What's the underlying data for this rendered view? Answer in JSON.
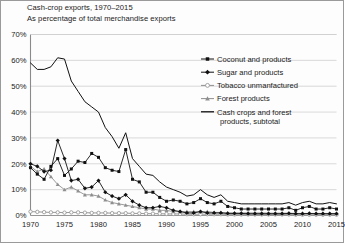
{
  "title": {
    "line1": "Cash-crop exports, 1970–2015",
    "line2": "As percentage of total merchandise exports"
  },
  "colors": {
    "coconut": "#111111",
    "sugar": "#111111",
    "tobacco": "#8f8f8f",
    "forest": "#8f8f8f",
    "subtotal": "#111111",
    "grid": "#cfcfcf",
    "axis": "#8a8a8a",
    "frame": "#9a9a9a",
    "text": "#1a1a1a",
    "background": "#fdfdfd"
  },
  "legend": {
    "position": "top-right",
    "items": [
      {
        "label": "Coconut and products",
        "marker": "filled-square",
        "color": "#111111"
      },
      {
        "label": "Sugar and products",
        "marker": "filled-diamond",
        "color": "#111111"
      },
      {
        "label": "Tobacco unmanfactured",
        "marker": "open-circle",
        "color": "#8f8f8f"
      },
      {
        "label": "Forest products",
        "marker": "filled-triangle",
        "color": "#8f8f8f"
      },
      {
        "label": "Cash crops and forest",
        "label2": "products, subtotal",
        "marker": "plain-line",
        "color": "#111111"
      }
    ]
  },
  "chart_data": {
    "type": "line",
    "title": "Cash-crop exports, 1970–2015",
    "subtitle": "As percentage of total merchandise exports",
    "xlabel": "",
    "ylabel": "As percentage of total merchandise exports",
    "xlim": [
      1970,
      2015
    ],
    "ylim": [
      0,
      70
    ],
    "ytick_labels": [
      "0%",
      "10%",
      "20%",
      "30%",
      "40%",
      "50%",
      "60%",
      "70%"
    ],
    "ytick_values": [
      0,
      10,
      20,
      30,
      40,
      50,
      60,
      70
    ],
    "xtick_labels": [
      "1970",
      "1975",
      "1980",
      "1985",
      "1990",
      "1995",
      "2000",
      "2005",
      "2010",
      "2015"
    ],
    "xtick_values": [
      1970,
      1975,
      1980,
      1985,
      1990,
      1995,
      2000,
      2005,
      2010,
      2015
    ],
    "grid": "horizontal",
    "x": [
      1970,
      1971,
      1972,
      1973,
      1974,
      1975,
      1976,
      1977,
      1978,
      1979,
      1980,
      1981,
      1982,
      1983,
      1984,
      1985,
      1986,
      1987,
      1988,
      1989,
      1990,
      1991,
      1992,
      1993,
      1994,
      1995,
      1996,
      1997,
      1998,
      1999,
      2000,
      2001,
      2002,
      2003,
      2004,
      2005,
      2006,
      2007,
      2008,
      2009,
      2010,
      2011,
      2012,
      2013,
      2014,
      2015
    ],
    "series": [
      {
        "name": "Coconut and products",
        "marker": "filled-square",
        "color": "#111111",
        "values": [
          18.5,
          16.0,
          14.0,
          19.0,
          22.0,
          15.5,
          18.0,
          21.0,
          20.5,
          24.0,
          22.5,
          18.5,
          17.5,
          17.0,
          25.5,
          14.0,
          13.0,
          9.0,
          9.0,
          7.0,
          5.5,
          6.0,
          5.5,
          4.5,
          5.0,
          6.5,
          5.0,
          4.5,
          5.5,
          3.5,
          3.0,
          2.5,
          2.5,
          2.5,
          2.5,
          2.5,
          2.5,
          2.5,
          3.0,
          2.0,
          3.0,
          3.5,
          2.5,
          2.5,
          3.0,
          2.5
        ]
      },
      {
        "name": "Sugar and products",
        "marker": "filled-diamond",
        "color": "#111111",
        "values": [
          20.0,
          19.0,
          17.0,
          17.5,
          29.0,
          22.0,
          13.5,
          14.0,
          10.5,
          11.0,
          13.5,
          9.0,
          7.5,
          6.5,
          8.0,
          5.5,
          4.0,
          3.0,
          3.0,
          3.5,
          3.0,
          2.0,
          1.5,
          1.0,
          1.0,
          1.5,
          1.0,
          1.0,
          1.0,
          0.8,
          0.8,
          0.8,
          0.7,
          0.7,
          0.7,
          0.7,
          0.7,
          0.7,
          0.8,
          0.7,
          0.7,
          0.8,
          0.7,
          0.7,
          0.7,
          0.7
        ]
      },
      {
        "name": "Tobacco unmanfactured",
        "marker": "open-circle",
        "color": "#8f8f8f",
        "values": [
          1.5,
          1.4,
          1.3,
          1.2,
          1.2,
          1.1,
          1.2,
          1.2,
          1.1,
          1.0,
          1.0,
          1.0,
          0.9,
          0.9,
          0.9,
          0.8,
          0.8,
          0.7,
          0.7,
          0.7,
          0.6,
          0.6,
          0.6,
          0.5,
          0.5,
          0.5,
          0.5,
          0.5,
          0.5,
          0.4,
          0.4,
          0.4,
          0.4,
          0.4,
          0.4,
          0.4,
          0.4,
          0.4,
          0.4,
          0.3,
          0.3,
          0.3,
          0.3,
          0.3,
          0.3,
          0.3
        ]
      },
      {
        "name": "Forest products",
        "marker": "filled-triangle",
        "color": "#8f8f8f",
        "values": [
          19.0,
          17.0,
          18.0,
          15.0,
          12.0,
          10.0,
          11.0,
          9.5,
          8.0,
          8.0,
          7.5,
          6.0,
          5.0,
          4.5,
          4.0,
          3.5,
          3.0,
          2.5,
          2.5,
          2.0,
          2.0,
          1.5,
          1.5,
          1.5,
          1.5,
          1.5,
          1.5,
          1.2,
          1.2,
          1.0,
          1.0,
          1.0,
          1.0,
          1.0,
          1.0,
          0.9,
          0.9,
          0.9,
          0.9,
          0.8,
          0.8,
          0.8,
          0.8,
          0.8,
          0.8,
          0.8
        ]
      },
      {
        "name": "Cash crops and forest products, subtotal",
        "marker": "plain-line",
        "color": "#111111",
        "values": [
          59.0,
          56.5,
          56.5,
          57.5,
          61.0,
          60.5,
          52.0,
          48.0,
          44.0,
          42.0,
          40.0,
          34.0,
          30.5,
          26.0,
          32.0,
          22.0,
          19.0,
          16.0,
          15.5,
          13.0,
          11.0,
          10.0,
          9.0,
          7.5,
          8.0,
          10.0,
          8.0,
          7.0,
          8.0,
          5.5,
          5.0,
          4.5,
          4.5,
          4.5,
          4.5,
          4.5,
          4.5,
          4.5,
          5.0,
          4.0,
          5.0,
          5.5,
          4.5,
          4.5,
          5.0,
          4.5
        ]
      }
    ]
  }
}
